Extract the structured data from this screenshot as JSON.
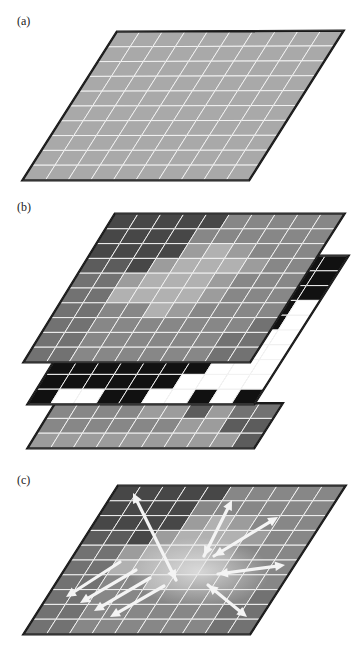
{
  "figure": {
    "panels": [
      {
        "id": "a",
        "label": "(a)",
        "label_pos": [
          17,
          14
        ]
      },
      {
        "id": "b",
        "label": "(b)",
        "label_pos": [
          17,
          200
        ]
      },
      {
        "id": "c",
        "label": "(c)",
        "label_pos": [
          17,
          473
        ]
      }
    ]
  },
  "colors": {
    "grid_line": "#f2f2f2",
    "border": "#1a1a1a",
    "uniform_gray": "#a9a9a9",
    "black": "#111111",
    "white": "#ffffff",
    "arrow": "#f4f4f4"
  },
  "palette": [
    "#474747",
    "#5c5c5c",
    "#727272",
    "#878787",
    "#9c9c9c",
    "#b1b1b1",
    "#c0c0c0"
  ],
  "grid": {
    "cols": 10,
    "rows": 10
  },
  "layers": {
    "a": {
      "tl": [
        117,
        32
      ],
      "tr": [
        343,
        31
      ],
      "bl": [
        23,
        180
      ],
      "br": [
        249,
        180
      ]
    },
    "b_top": {
      "tl": [
        115,
        214
      ],
      "tr": [
        344,
        214
      ],
      "bl": [
        24,
        362
      ],
      "br": [
        250,
        362
      ]
    },
    "b_mid": {
      "tl": [
        119,
        256
      ],
      "tr": [
        348,
        256
      ],
      "bl": [
        28,
        404
      ],
      "br": [
        254,
        404
      ]
    },
    "b_bot": {
      "tl": [
        119,
        300
      ],
      "tr": [
        348,
        300
      ],
      "bl": [
        28,
        448
      ],
      "br": [
        254,
        448
      ]
    },
    "c": {
      "tl": [
        118,
        486
      ],
      "tr": [
        345,
        486
      ],
      "bl": [
        24,
        634
      ],
      "br": [
        250,
        634
      ]
    }
  },
  "height_map": [
    [
      0,
      0,
      0,
      0,
      0,
      3,
      3,
      3,
      3,
      3
    ],
    [
      0,
      0,
      0,
      0,
      3,
      3,
      3,
      3,
      3,
      3
    ],
    [
      0,
      0,
      0,
      0,
      4,
      5,
      4,
      3,
      3,
      3
    ],
    [
      1,
      1,
      0,
      4,
      5,
      5,
      5,
      4,
      3,
      3
    ],
    [
      2,
      2,
      4,
      5,
      5,
      5,
      4,
      3,
      3,
      3
    ],
    [
      2,
      2,
      5,
      5,
      5,
      5,
      4,
      3,
      3,
      3
    ],
    [
      2,
      2,
      3,
      3,
      5,
      4,
      3,
      3,
      3,
      3
    ],
    [
      2,
      2,
      3,
      3,
      3,
      3,
      3,
      3,
      3,
      2
    ],
    [
      2,
      2,
      3,
      3,
      3,
      3,
      3,
      3,
      2,
      2
    ],
    [
      2,
      2,
      3,
      3,
      3,
      3,
      3,
      3,
      2,
      2
    ]
  ],
  "mask_map": [
    [
      1,
      1,
      1,
      1,
      1,
      1,
      1,
      1,
      1,
      1
    ],
    [
      1,
      1,
      1,
      1,
      1,
      1,
      1,
      1,
      1,
      1
    ],
    [
      1,
      1,
      1,
      1,
      1,
      1,
      1,
      1,
      1,
      1
    ],
    [
      1,
      1,
      1,
      1,
      1,
      1,
      1,
      1,
      1,
      0
    ],
    [
      1,
      1,
      1,
      1,
      1,
      1,
      1,
      1,
      1,
      0
    ],
    [
      1,
      1,
      1,
      1,
      1,
      1,
      1,
      1,
      0,
      0
    ],
    [
      1,
      1,
      1,
      1,
      1,
      1,
      1,
      1,
      0,
      0
    ],
    [
      1,
      1,
      1,
      1,
      1,
      1,
      1,
      0,
      0,
      0
    ],
    [
      1,
      1,
      1,
      1,
      1,
      1,
      0,
      0,
      0,
      0
    ],
    [
      1,
      0,
      0,
      1,
      1,
      0,
      0,
      1,
      0,
      1
    ]
  ],
  "bottom_map": [
    [
      3,
      3,
      3,
      3,
      4,
      4,
      1,
      4,
      2,
      2
    ],
    [
      3,
      3,
      3,
      3,
      3,
      3,
      4,
      4,
      1,
      1
    ],
    [
      4,
      4,
      4,
      4,
      4,
      4,
      4,
      4,
      4,
      1
    ]
  ],
  "flow_arrows": [
    {
      "from": [
        176,
        580
      ],
      "to": [
        133,
        493
      ],
      "double": true
    },
    {
      "from": [
        204,
        556
      ],
      "to": [
        232,
        500
      ],
      "double": true
    },
    {
      "from": [
        214,
        556
      ],
      "to": [
        278,
        517
      ],
      "double": true
    },
    {
      "from": [
        218,
        574
      ],
      "to": [
        285,
        565
      ],
      "double": true
    },
    {
      "from": [
        208,
        585
      ],
      "to": [
        247,
        617
      ],
      "double": true
    },
    {
      "from": [
        120,
        562
      ],
      "to": [
        66,
        597
      ],
      "double": false
    },
    {
      "from": [
        136,
        570
      ],
      "to": [
        80,
        603
      ],
      "double": false
    },
    {
      "from": [
        150,
        578
      ],
      "to": [
        94,
        611
      ],
      "double": false
    },
    {
      "from": [
        164,
        586
      ],
      "to": [
        110,
        617
      ],
      "double": false
    }
  ],
  "flow_center": [
    200,
    572
  ]
}
